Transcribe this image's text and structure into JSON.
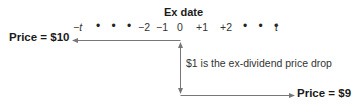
{
  "diagram": {
    "title": "Ex date",
    "timeline_ticks": [
      "−t",
      "−2",
      "−1",
      "0",
      "+1",
      "+2",
      "t"
    ],
    "ellipsis": "• • •",
    "left_price_label": "Price = $10",
    "right_price_label": "Price = $9",
    "annotation": "$1 is the ex-dividend price drop",
    "line_color": "#777777"
  }
}
